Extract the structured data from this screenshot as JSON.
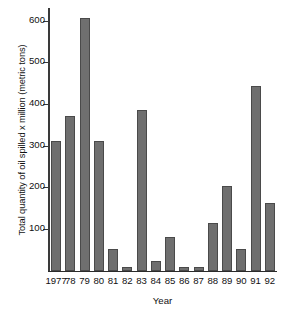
{
  "chart_data": {
    "type": "bar",
    "title": "",
    "xlabel": "Year",
    "ylabel": "Total quantity of oil spilled x million (metric tons)",
    "categories": [
      "1977",
      "78",
      "79",
      "80",
      "81",
      "82",
      "83",
      "84",
      "85",
      "86",
      "87",
      "88",
      "89",
      "90",
      "91",
      "92"
    ],
    "values": [
      310,
      372,
      607,
      310,
      52,
      8,
      385,
      22,
      80,
      8,
      8,
      115,
      202,
      52,
      443,
      163
    ],
    "ylim": [
      0,
      630
    ],
    "yticks": [
      100,
      200,
      300,
      400,
      500,
      600
    ],
    "ytick_labels": [
      "100",
      "200",
      "300",
      "400",
      "500",
      "600"
    ],
    "grid": false,
    "legend": false,
    "bar_color": "#6f6f6f",
    "bar_edge_color": "#4a4a4a",
    "axis_color": "#2b2b2b",
    "background": "#ffffff"
  }
}
